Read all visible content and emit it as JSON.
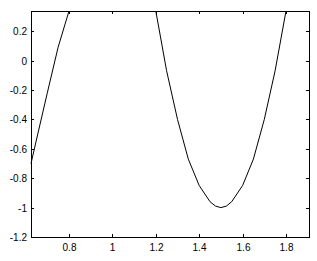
{
  "chart_data": {
    "type": "line",
    "title": "",
    "xlabel": "",
    "ylabel": "",
    "xlim": [
      0.625,
      1.906
    ],
    "ylim": [
      -1.2,
      0.337
    ],
    "grid": false,
    "legend": null,
    "x_ticks": [
      0.8,
      1,
      1.2,
      1.4,
      1.6,
      1.8
    ],
    "x_tick_labels": [
      "0.8",
      "1",
      "1.2",
      "1.4",
      "1.6",
      "1.8"
    ],
    "y_ticks": [
      0.2,
      0,
      -0.2,
      -0.4,
      -0.6,
      -0.8,
      -1,
      -1.2
    ],
    "y_tick_labels": [
      "0.2",
      "0",
      "-0.2",
      "-0.4",
      "-0.6",
      "-0.8",
      "-1",
      "-1.2"
    ],
    "series": [
      {
        "name": "left-branch",
        "color": "#000000",
        "x": [
          0.625,
          0.65,
          0.7,
          0.75,
          0.8
        ],
        "y": [
          -0.7,
          -0.54,
          -0.22,
          0.09,
          0.337
        ]
      },
      {
        "name": "parabola",
        "color": "#000000",
        "x": [
          1.2,
          1.25,
          1.3,
          1.35,
          1.4,
          1.45,
          1.475,
          1.5,
          1.525,
          1.55,
          1.6,
          1.65,
          1.7,
          1.75,
          1.8
        ],
        "y": [
          0.337,
          -0.07,
          -0.4,
          -0.67,
          -0.85,
          -0.96,
          -0.99,
          -1.0,
          -0.99,
          -0.96,
          -0.85,
          -0.67,
          -0.4,
          -0.07,
          0.337
        ]
      }
    ]
  },
  "layout": {
    "plot_left": 31,
    "plot_right": 309,
    "plot_top": 11,
    "plot_bottom": 237
  }
}
